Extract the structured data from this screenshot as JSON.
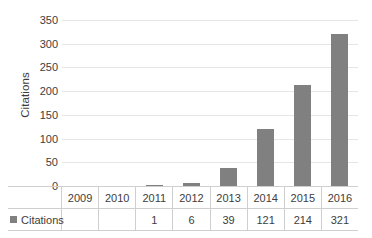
{
  "chart_data": {
    "type": "bar",
    "title": "",
    "xlabel": "",
    "ylabel": "Citations",
    "categories": [
      "2009",
      "2010",
      "2011",
      "2012",
      "2013",
      "2014",
      "2015",
      "2016"
    ],
    "values": [
      0,
      0,
      1,
      6,
      39,
      121,
      214,
      321
    ],
    "value_labels": [
      "",
      "",
      "1",
      "6",
      "39",
      "121",
      "214",
      "321"
    ],
    "series": [
      {
        "name": "Citations",
        "values": [
          0,
          0,
          1,
          6,
          39,
          121,
          214,
          321
        ],
        "color": "#808080"
      }
    ],
    "ylim": [
      0,
      350
    ],
    "ytick_values": [
      350,
      300,
      250,
      200,
      150,
      100,
      50,
      0
    ],
    "ytick_labels": [
      "350",
      "300",
      "250",
      "200",
      "150",
      "100",
      "50",
      "0"
    ],
    "grid": true,
    "grid_axis": "y",
    "legend_position": "data-table-left",
    "data_table_visible": true
  },
  "legend": {
    "series_label": "Citations",
    "swatch_color": "#808080"
  },
  "axis": {
    "y_title": "Citations"
  },
  "colors": {
    "bar": "#808080",
    "gridline": "#e6e6e6",
    "table_border": "#cfcfcf",
    "text": "#3d3d3d",
    "background": "#ffffff"
  }
}
